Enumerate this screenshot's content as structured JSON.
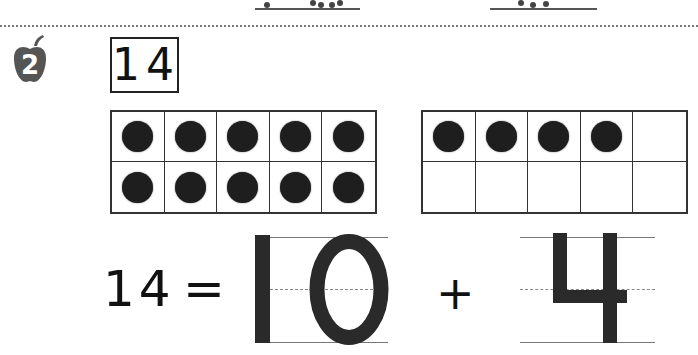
{
  "worksheet": {
    "problem_number": "2",
    "target_number": "14",
    "ten_frames": [
      {
        "filled": 10,
        "total": 10
      },
      {
        "filled": 4,
        "total": 10
      }
    ],
    "equation": {
      "left": "14",
      "equals": "=",
      "tens": "10",
      "plus": "+",
      "ones": "4"
    }
  },
  "colors": {
    "ink": "#222222",
    "counter": "#1e1e1e",
    "apple": "#555555",
    "guide_line": "#777777"
  }
}
